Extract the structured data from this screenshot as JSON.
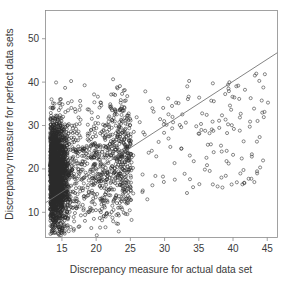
{
  "chart_data": {
    "type": "scatter",
    "title": "",
    "xlabel": "Discrepancy measure for actual data set",
    "ylabel": "Discrepancy measure for perfect data sets",
    "xticks": [
      15,
      20,
      25,
      30,
      35,
      40,
      45
    ],
    "yticks": [
      10,
      20,
      30,
      40,
      50
    ],
    "xlim": [
      12.6,
      46.5
    ],
    "ylim": [
      4.2,
      56.5
    ],
    "grid": false,
    "legend": null,
    "marker": "open-circle",
    "marker_color": "#2b2b2b",
    "frame_color": "#8a8a8a",
    "annotations": [],
    "fit_line": {
      "label": "reference line",
      "color": "#6e6e6e",
      "x0": 12.6,
      "y0": 12.2,
      "x1": 46.5,
      "y1": 46.8
    },
    "n_points": 3000,
    "cluster": {
      "x_mode": 14.2,
      "y_mode": 19.0,
      "x_spread": 2.6,
      "y_spread": 6.2
    }
  },
  "figure": {
    "width": 288,
    "height": 284,
    "background": "#ffffff"
  },
  "axes": {
    "x_tick_labels": [
      "15",
      "20",
      "25",
      "30",
      "35",
      "40",
      "45"
    ],
    "y_tick_labels": [
      "10",
      "20",
      "30",
      "40",
      "50"
    ],
    "x_axis_title": "Discrepancy measure for actual data set",
    "y_axis_title": "Discrepancy measure for perfect data sets"
  }
}
